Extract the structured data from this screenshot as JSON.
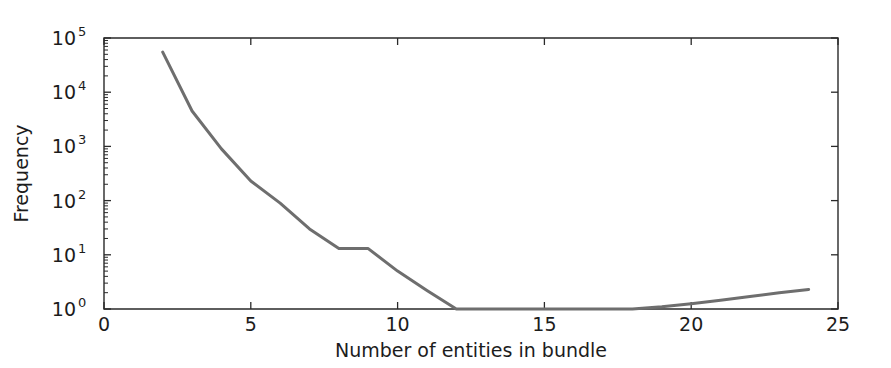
{
  "chart_data": {
    "type": "line",
    "title": "",
    "xlabel": "Number of entities in bundle",
    "ylabel": "Frequency",
    "xlim": [
      0,
      25
    ],
    "ylim": [
      1,
      100000
    ],
    "yscale": "log",
    "xscale": "linear",
    "grid": false,
    "legend": null,
    "line_color": "#6e6e6e",
    "axis_color": "#2a2a2a",
    "x": [
      2,
      3,
      4,
      5,
      6,
      7,
      8,
      9,
      10,
      11,
      12,
      13,
      14,
      15,
      16,
      17,
      18,
      19,
      20,
      21,
      22,
      23,
      24
    ],
    "values": [
      55000,
      4500,
      900,
      230,
      90,
      30,
      13,
      13,
      5,
      2.2,
      1,
      1,
      1,
      1,
      1,
      1,
      1,
      1.1,
      1.25,
      1.45,
      1.7,
      2.0,
      2.3
    ],
    "series": [
      {
        "name": "bundle-size-frequency",
        "values": [
          55000,
          4500,
          900,
          230,
          90,
          30,
          13,
          13,
          5,
          2.2,
          1,
          1,
          1,
          1,
          1,
          1,
          1,
          1.1,
          1.25,
          1.45,
          1.7,
          2.0,
          2.3
        ]
      }
    ],
    "x_ticks": [
      {
        "value": 0,
        "label": "0"
      },
      {
        "value": 5,
        "label": "5"
      },
      {
        "value": 10,
        "label": "10"
      },
      {
        "value": 15,
        "label": "15"
      },
      {
        "value": 20,
        "label": "20"
      },
      {
        "value": 25,
        "label": "25"
      }
    ],
    "y_ticks": [
      {
        "value": 1,
        "base": "10",
        "exponent": "0"
      },
      {
        "value": 10,
        "base": "10",
        "exponent": "1"
      },
      {
        "value": 100,
        "base": "10",
        "exponent": "2"
      },
      {
        "value": 1000,
        "base": "10",
        "exponent": "3"
      },
      {
        "value": 10000,
        "base": "10",
        "exponent": "4"
      },
      {
        "value": 100000,
        "base": "10",
        "exponent": "5"
      }
    ]
  },
  "axes": {
    "xlabel": "Number of entities in bundle",
    "ylabel": "Frequency"
  },
  "xtick_labels": {
    "t0": "0",
    "t1": "5",
    "t2": "10",
    "t3": "15",
    "t4": "20",
    "t5": "25"
  },
  "ytick_labels": {
    "base": "10",
    "e0": "0",
    "e1": "1",
    "e2": "2",
    "e3": "3",
    "e4": "4",
    "e5": "5"
  }
}
